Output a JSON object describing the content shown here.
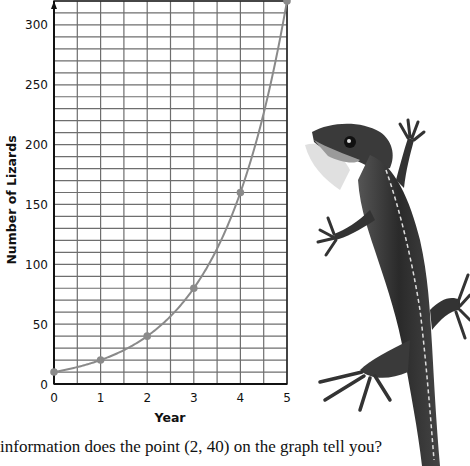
{
  "chart_data": {
    "type": "line",
    "title": "",
    "xlabel": "Year",
    "ylabel": "Number of Lizards",
    "x": [
      0,
      1,
      2,
      3,
      4,
      5
    ],
    "series": [
      {
        "name": "Number of Lizards",
        "values": [
          10,
          20,
          40,
          80,
          160,
          320
        ]
      }
    ],
    "x_ticks": [
      "0",
      "1",
      "2",
      "3",
      "4",
      "5"
    ],
    "y_ticks": [
      "0",
      "50",
      "100",
      "150",
      "200",
      "250",
      "300"
    ],
    "xlim": [
      0,
      5
    ],
    "ylim": [
      0,
      320
    ],
    "grid": true,
    "grid_x_step": 0.5,
    "grid_y_step": 10,
    "legend": "none",
    "colors": {
      "curve": "#8a8a8a",
      "points": "#8a8a8a",
      "grid": "#6e6e6e",
      "axis": "#111111"
    }
  },
  "question": {
    "text": "information does the point (2, 40) on the graph tell you?"
  }
}
